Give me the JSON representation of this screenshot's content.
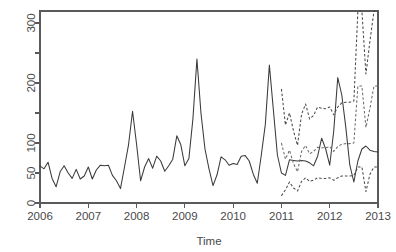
{
  "chart_data": {
    "type": "line",
    "title": "",
    "xlabel": "Time",
    "ylabel": "",
    "grid": false,
    "legend": "none",
    "xlim": [
      2006.0,
      2013.0
    ],
    "ylim": [
      0,
      320
    ],
    "x_ticks": [
      2006,
      2007,
      2008,
      2009,
      2010,
      2011,
      2012,
      2013
    ],
    "x_tick_labels": [
      "2006",
      "2007",
      "2008",
      "2009",
      "2010",
      "2011",
      "2012",
      "2013"
    ],
    "y_ticks": [
      0,
      50,
      100,
      150,
      200,
      250,
      300
    ],
    "y_tick_labels": [
      "0",
      "50",
      "100",
      "",
      "200",
      "",
      "300"
    ],
    "y_labeled_ticks": [
      0,
      50,
      100,
      200,
      300
    ],
    "series": [
      {
        "name": "observed",
        "style": "solid",
        "color": "#3a3a3a",
        "x_start": 2006.0,
        "x_step": 0.0833333,
        "values": [
          62,
          57,
          68,
          41,
          27,
          52,
          62,
          50,
          41,
          56,
          40,
          45,
          60,
          40,
          55,
          63,
          62,
          63,
          46,
          37,
          24,
          60,
          97,
          153,
          98,
          37,
          60,
          74,
          58,
          78,
          70,
          53,
          62,
          73,
          112,
          97,
          62,
          74,
          140,
          240,
          150,
          90,
          57,
          29,
          47,
          77,
          72,
          63,
          66,
          64,
          78,
          79,
          70,
          48,
          33,
          80,
          131,
          230,
          155,
          80,
          50,
          46,
          72,
          71,
          70,
          71,
          70,
          67,
          62,
          78,
          108,
          90,
          63,
          120,
          209,
          180,
          126,
          63,
          35,
          70,
          90,
          95,
          88,
          86,
          85,
          80,
          98,
          82,
          84,
          92,
          90,
          100,
          87,
          120,
          150,
          307
        ]
      },
      {
        "name": "forecast_upper",
        "style": "dashed",
        "color": "#4a4a4a",
        "x_start": 2011.0,
        "x_step": 0.0833333,
        "values": [
          190,
          130,
          150,
          120,
          96,
          148,
          165,
          140,
          146,
          160,
          158,
          157,
          160,
          147,
          160,
          167,
          168,
          168,
          170,
          330,
          330,
          215,
          270,
          330,
          330,
          240,
          175,
          165,
          160,
          166,
          168,
          160,
          164,
          168,
          166,
          170,
          172,
          166,
          176,
          330,
          330
        ]
      },
      {
        "name": "forecast_mid",
        "style": "dashed",
        "color": "#6d6d6d",
        "x_start": 2011.0,
        "x_step": 0.0833333,
        "values": [
          100,
          73,
          88,
          66,
          52,
          86,
          96,
          82,
          86,
          93,
          92,
          92,
          94,
          86,
          94,
          98,
          99,
          99,
          100,
          195,
          195,
          126,
          158,
          195,
          195,
          141,
          103,
          97,
          94,
          98,
          99,
          94,
          97,
          99,
          98,
          100,
          101,
          98,
          104,
          195,
          195
        ]
      },
      {
        "name": "forecast_lower",
        "style": "dashed",
        "color": "#4a4a4a",
        "x_start": 2011.0,
        "x_step": 0.0833333,
        "values": [
          12,
          22,
          35,
          25,
          20,
          36,
          42,
          36,
          38,
          42,
          41,
          41,
          42,
          38,
          42,
          45,
          45,
          45,
          46,
          60,
          60,
          19,
          48,
          60,
          60,
          44,
          46,
          44,
          42,
          44,
          45,
          43,
          44,
          45,
          45,
          46,
          46,
          45,
          48,
          60,
          60
        ]
      }
    ]
  },
  "axis": {
    "x_title": "Time"
  },
  "plot_geometry": {
    "left": 40,
    "right": 378,
    "top": 11,
    "bottom": 203
  }
}
